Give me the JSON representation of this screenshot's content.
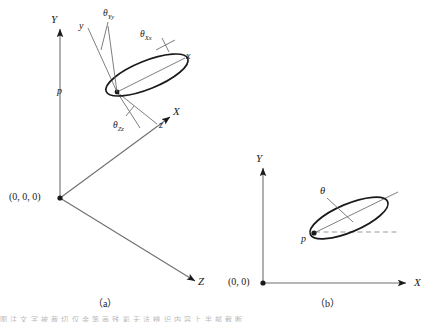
{
  "figure": {
    "stroke_color": "#1a1a1a",
    "light_stroke_color": "#6f6f6f",
    "dashed_color": "#9a9a9a",
    "background": "#ffffff"
  },
  "panel_a": {
    "caption": "（a）",
    "origin_label": "(0, 0, 0)",
    "global_axes": [
      {
        "name": "Y",
        "label": "Y",
        "direction": "up"
      },
      {
        "name": "X",
        "label": "X",
        "direction": "upper-right"
      },
      {
        "name": "Z",
        "label": "Z",
        "direction": "lower-right"
      }
    ],
    "local_axes": [
      {
        "name": "y",
        "label": "y"
      },
      {
        "name": "x",
        "label": "x"
      },
      {
        "name": "z",
        "label": "z"
      }
    ],
    "point_label": "p",
    "angles": [
      {
        "name": "theta-Yy",
        "symbol": "θ",
        "subscript": "Yy"
      },
      {
        "name": "theta-Xx",
        "symbol": "θ",
        "subscript": "Xx"
      },
      {
        "name": "theta-Zz",
        "symbol": "θ",
        "subscript": "Zz"
      }
    ]
  },
  "panel_b": {
    "caption": "（b）",
    "origin_label": "(0, 0)",
    "axes": [
      {
        "name": "Y",
        "label": "Y",
        "direction": "up"
      },
      {
        "name": "X",
        "label": "X",
        "direction": "right"
      }
    ],
    "point_label": "p",
    "angle": {
      "name": "theta",
      "symbol": "θ",
      "subscript": ""
    }
  },
  "footer": {
    "smear_text": "图 注 文 字 被 裁 切   仅 余 笔 画 残 影   无 法 辨 识 内 容   上 半 部 截 断"
  }
}
